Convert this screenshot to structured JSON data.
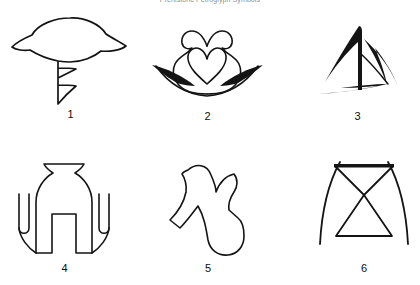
{
  "plate": {
    "background_color": "#ffffff",
    "ink_color": "#141414",
    "caption": "Prehistoric Petroglyph Symbols",
    "caption_color": "#8d8d8d",
    "width": 420,
    "height": 285,
    "columns": 3,
    "rows": 2
  },
  "figures": [
    {
      "number": "1",
      "name": "hat-with-zigzag-tail",
      "description": "Dome or hat shaped outline with flared brim and a descending zigzag tail",
      "label_x": 62,
      "label_y": 115
    },
    {
      "number": "2",
      "name": "heart-with-wings",
      "description": "Bulb outline with two inward curling scrolls enclosing a heart, flanked by two tapered wing arcs",
      "label_x": 206,
      "label_y": 115
    },
    {
      "number": "3",
      "name": "triangular-pinwheel",
      "description": "Three tapered curved strokes arranged as a triangular pinwheel",
      "label_x": 355,
      "label_y": 115
    },
    {
      "number": "4",
      "name": "urn-with-side-hooks",
      "description": "Flared neck urn with rounded body, two legs and two U shaped side hooks",
      "label_x": 63,
      "label_y": 263
    },
    {
      "number": "5",
      "name": "notched-blob-with-leg",
      "description": "Irregular rounded blob with a deep notch at the top and a leg extending to the lower left",
      "label_x": 207,
      "label_y": 263
    },
    {
      "number": "6",
      "name": "hourglass-with-crossed-arcs",
      "description": "Hourglass or bowtie outline with two long arcs crossing through its waist",
      "label_x": 363,
      "label_y": 263
    }
  ]
}
